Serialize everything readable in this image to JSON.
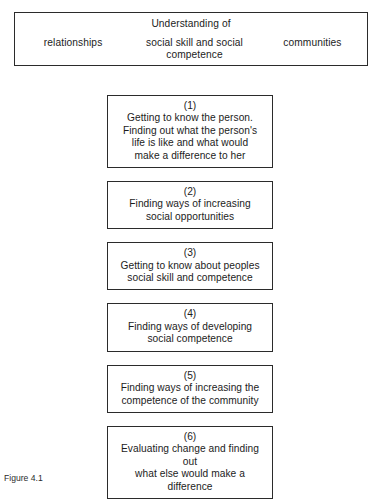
{
  "figure": {
    "background_color": "#ffffff",
    "line_color": "#2b2b2b",
    "text_color": "#1c1c1c",
    "caption": "Figure 4.1"
  },
  "header": {
    "title": "Understanding of",
    "columns": [
      {
        "label": "relationships"
      },
      {
        "label": "social skill and social\ncompetence"
      },
      {
        "label": "communities"
      }
    ]
  },
  "steps": [
    {
      "number": "(1)",
      "text": "Getting to know the person.\nFinding out what the person's\nlife is like and what would\nmake a difference to her"
    },
    {
      "number": "(2)",
      "text": "Finding ways of increasing\nsocial opportunities"
    },
    {
      "number": "(3)",
      "text": "Getting to know about peoples\nsocial skill and competence"
    },
    {
      "number": "(4)",
      "text": "Finding ways of developing\nsocial competence"
    },
    {
      "number": "(5)",
      "text": "Finding ways of increasing the\ncompetence of the community"
    },
    {
      "number": "(6)",
      "text": "Evaluating change and finding out\nwhat else would make a\ndifference"
    }
  ]
}
